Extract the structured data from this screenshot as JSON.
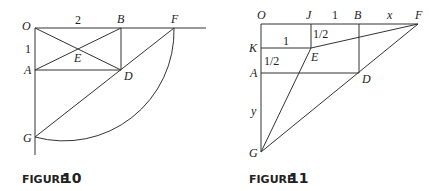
{
  "figures": [
    {
      "caption_word": "FIGURE",
      "caption_number": "10",
      "points": {
        "O": "O",
        "A": "A",
        "B": "B",
        "D": "D",
        "E": "E",
        "F": "F",
        "G": "G"
      },
      "measures": {
        "OB": "2",
        "OA": "1"
      }
    },
    {
      "caption_word": "FIGURE",
      "caption_number": "11",
      "points": {
        "O": "O",
        "J": "J",
        "B": "B",
        "F": "F",
        "K": "K",
        "E": "E",
        "A": "A",
        "D": "D",
        "G": "G"
      },
      "measures": {
        "JB": "1",
        "BF": "x",
        "KE": "1",
        "JE": "1/2",
        "KA": "1/2",
        "AG": "y"
      }
    }
  ]
}
